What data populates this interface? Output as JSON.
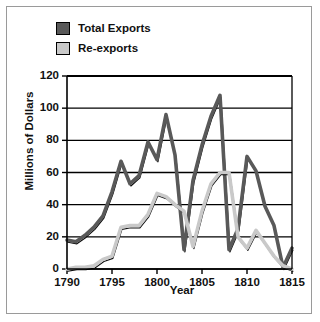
{
  "figure": {
    "background_color": "#ffffff",
    "frame_color": "#9a9a9a"
  },
  "legend": {
    "position": "top-left",
    "items": [
      {
        "label": "Total Exports",
        "color": "#595959",
        "swatch_name": "legend-swatch-total-exports"
      },
      {
        "label": "Re-exports",
        "color": "#c9c9c9",
        "swatch_name": "legend-swatch-re-exports"
      }
    ]
  },
  "chart_data": {
    "type": "line",
    "title": "",
    "subtitle": "",
    "xlabel": "Year",
    "ylabel": "Millions of Dollars",
    "xlim": [
      1790,
      1815
    ],
    "ylim": [
      0,
      120
    ],
    "xticks": [
      1790,
      1795,
      1800,
      1805,
      1810,
      1815
    ],
    "xtick_labels": [
      "1790",
      "1795",
      "1800",
      "1805",
      "1810",
      "1815"
    ],
    "yticks": [
      0,
      20,
      40,
      60,
      80,
      100,
      120
    ],
    "ytick_labels": [
      "0",
      "20",
      "40",
      "60",
      "80",
      "100",
      "120"
    ],
    "grid": "horizontal",
    "legend_position": "above-plot-left",
    "x": [
      1790,
      1791,
      1792,
      1793,
      1794,
      1795,
      1796,
      1797,
      1798,
      1799,
      1800,
      1801,
      1802,
      1803,
      1804,
      1805,
      1806,
      1807,
      1808,
      1809,
      1810,
      1811,
      1812,
      1813,
      1814,
      1815
    ],
    "series": [
      {
        "name": "Total Exports",
        "color": "#595959",
        "values": [
          18,
          17,
          21,
          26,
          33,
          48,
          67,
          53,
          58,
          79,
          68,
          96,
          71,
          12,
          55,
          77,
          95,
          108,
          12,
          25,
          70,
          61,
          39,
          27,
          1,
          13
        ]
      },
      {
        "name": "Re-exports",
        "color": "#c9c9c9",
        "values": [
          0,
          1,
          1,
          2,
          6,
          8,
          26,
          27,
          27,
          34,
          47,
          45,
          40,
          36,
          14,
          36,
          53,
          60,
          60,
          20,
          13,
          24,
          16,
          8,
          2,
          0
        ]
      }
    ],
    "annotations": []
  }
}
